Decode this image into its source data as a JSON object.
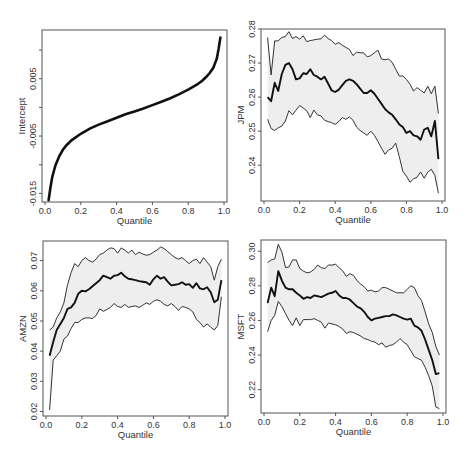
{
  "figure": {
    "layout": "2x2 grid of quantile regression coefficient plots",
    "colors": {
      "band": "#eeeeee",
      "estimate": "#111111",
      "bound": "#333333",
      "frame": "#555555"
    }
  },
  "chart_data": [
    {
      "id": "intercept",
      "type": "line",
      "title": "",
      "xlabel": "Quantile",
      "ylabel": "Intercept",
      "xlim": [
        0.0,
        1.0
      ],
      "ylim": [
        -0.0165,
        0.0135
      ],
      "xticks": [
        0.0,
        0.2,
        0.4,
        0.6,
        0.8,
        1.0
      ],
      "xtick_labels": [
        "0.0",
        "0.2",
        "0.4",
        "0.6",
        "0.8",
        "1.0"
      ],
      "yticks": [
        -0.015,
        -0.01,
        -0.005,
        0.0,
        0.005,
        0.01
      ],
      "ytick_labels": [
        "-0.015",
        "",
        "-0.005",
        "",
        "0.005",
        ""
      ],
      "grid": false,
      "has_band": false,
      "x": [
        0.02,
        0.03,
        0.04,
        0.05,
        0.06,
        0.08,
        0.1,
        0.12,
        0.15,
        0.2,
        0.25,
        0.3,
        0.35,
        0.4,
        0.45,
        0.5,
        0.55,
        0.6,
        0.65,
        0.7,
        0.75,
        0.8,
        0.85,
        0.88,
        0.9,
        0.92,
        0.94,
        0.96,
        0.97,
        0.98
      ],
      "estimate": [
        -0.0162,
        -0.014,
        -0.0122,
        -0.011,
        -0.01,
        -0.0085,
        -0.0074,
        -0.0066,
        -0.0057,
        -0.0046,
        -0.0037,
        -0.003,
        -0.0024,
        -0.0018,
        -0.0012,
        -0.0007,
        -0.0002,
        0.0004,
        0.001,
        0.0016,
        0.0023,
        0.0031,
        0.004,
        0.0047,
        0.0053,
        0.006,
        0.0069,
        0.0085,
        0.0102,
        0.0122
      ]
    },
    {
      "id": "jpm",
      "type": "line",
      "title": "",
      "xlabel": "Quantile",
      "ylabel": "JPM",
      "xlim": [
        0.0,
        1.0
      ],
      "ylim": [
        0.2295,
        0.28
      ],
      "xticks": [
        0.0,
        0.2,
        0.4,
        0.6,
        0.8,
        1.0
      ],
      "xtick_labels": [
        "0.0",
        "0.2",
        "0.4",
        "0.6",
        "0.8",
        "1.0"
      ],
      "yticks": [
        0.24,
        0.25,
        0.26,
        0.27,
        0.28
      ],
      "ytick_labels": [
        "0.24",
        "0.25",
        "0.26",
        "0.27",
        "0.28"
      ],
      "grid": false,
      "has_band": true,
      "x": [
        0.02,
        0.04,
        0.06,
        0.08,
        0.1,
        0.12,
        0.14,
        0.16,
        0.18,
        0.2,
        0.22,
        0.24,
        0.26,
        0.28,
        0.3,
        0.32,
        0.34,
        0.36,
        0.38,
        0.4,
        0.42,
        0.44,
        0.46,
        0.48,
        0.5,
        0.52,
        0.54,
        0.56,
        0.58,
        0.6,
        0.62,
        0.64,
        0.66,
        0.68,
        0.7,
        0.72,
        0.74,
        0.76,
        0.78,
        0.8,
        0.82,
        0.84,
        0.86,
        0.88,
        0.9,
        0.92,
        0.94,
        0.96,
        0.98
      ],
      "upper": [
        0.2775,
        0.2665,
        0.2765,
        0.2765,
        0.2775,
        0.2778,
        0.2792,
        0.2772,
        0.2778,
        0.277,
        0.278,
        0.2763,
        0.2766,
        0.2768,
        0.277,
        0.2771,
        0.2782,
        0.2772,
        0.2766,
        0.2755,
        0.276,
        0.2752,
        0.2746,
        0.274,
        0.2722,
        0.2732,
        0.273,
        0.273,
        0.2718,
        0.2722,
        0.273,
        0.2738,
        0.2712,
        0.271,
        0.2712,
        0.2702,
        0.2682,
        0.2662,
        0.2662,
        0.2652,
        0.2638,
        0.2618,
        0.2628,
        0.262,
        0.2612,
        0.2632,
        0.261,
        0.2632,
        0.2552
      ],
      "estimate": [
        0.26,
        0.2588,
        0.2642,
        0.2618,
        0.2668,
        0.2695,
        0.27,
        0.2682,
        0.2652,
        0.2655,
        0.267,
        0.2668,
        0.2682,
        0.2665,
        0.266,
        0.2652,
        0.266,
        0.264,
        0.262,
        0.2615,
        0.2622,
        0.2635,
        0.2648,
        0.2652,
        0.2648,
        0.2638,
        0.2625,
        0.2612,
        0.2612,
        0.262,
        0.261,
        0.2595,
        0.258,
        0.2565,
        0.2555,
        0.2548,
        0.2535,
        0.252,
        0.2512,
        0.2495,
        0.25,
        0.2488,
        0.2485,
        0.2475,
        0.2505,
        0.251,
        0.2485,
        0.253,
        0.2418
      ],
      "lower": [
        0.2535,
        0.2508,
        0.2502,
        0.251,
        0.2515,
        0.253,
        0.256,
        0.2548,
        0.2562,
        0.2575,
        0.2568,
        0.256,
        0.254,
        0.2562,
        0.2548,
        0.2545,
        0.2532,
        0.2528,
        0.2525,
        0.252,
        0.2528,
        0.254,
        0.2535,
        0.2542,
        0.2532,
        0.2512,
        0.2502,
        0.2495,
        0.2488,
        0.25,
        0.2488,
        0.247,
        0.245,
        0.2432,
        0.2445,
        0.245,
        0.2465,
        0.2425,
        0.2382,
        0.2368,
        0.235,
        0.236,
        0.2365,
        0.238,
        0.2362,
        0.238,
        0.2388,
        0.237,
        0.2318
      ]
    },
    {
      "id": "amzn",
      "type": "line",
      "title": "",
      "xlabel": "Quantile",
      "ylabel": "AMZN",
      "xlim": [
        0.0,
        1.0
      ],
      "ylim": [
        0.0185,
        0.0765
      ],
      "xticks": [
        0.0,
        0.2,
        0.4,
        0.6,
        0.8,
        1.0
      ],
      "xtick_labels": [
        "0.0",
        "0.2",
        "0.4",
        "0.6",
        "0.8",
        "1.0"
      ],
      "yticks": [
        0.02,
        0.03,
        0.04,
        0.05,
        0.06,
        0.07
      ],
      "ytick_labels": [
        "0.02",
        "0.03",
        "0.04",
        "0.05",
        "0.06",
        "0.07"
      ],
      "grid": false,
      "has_band": true,
      "x": [
        0.02,
        0.04,
        0.06,
        0.08,
        0.1,
        0.12,
        0.14,
        0.16,
        0.18,
        0.2,
        0.22,
        0.24,
        0.26,
        0.28,
        0.3,
        0.32,
        0.34,
        0.36,
        0.38,
        0.4,
        0.42,
        0.44,
        0.46,
        0.48,
        0.5,
        0.52,
        0.54,
        0.56,
        0.58,
        0.6,
        0.62,
        0.64,
        0.66,
        0.68,
        0.7,
        0.72,
        0.74,
        0.76,
        0.78,
        0.8,
        0.82,
        0.84,
        0.86,
        0.88,
        0.9,
        0.92,
        0.94,
        0.96,
        0.98
      ],
      "upper": [
        0.047,
        0.048,
        0.051,
        0.053,
        0.056,
        0.062,
        0.066,
        0.069,
        0.068,
        0.07,
        0.071,
        0.07,
        0.0695,
        0.0705,
        0.072,
        0.0725,
        0.0735,
        0.0742,
        0.074,
        0.0725,
        0.0742,
        0.0735,
        0.0725,
        0.0735,
        0.072,
        0.0728,
        0.0722,
        0.0718,
        0.072,
        0.0728,
        0.0735,
        0.0745,
        0.074,
        0.073,
        0.072,
        0.071,
        0.0705,
        0.071,
        0.07,
        0.069,
        0.07,
        0.0705,
        0.069,
        0.071,
        0.0695,
        0.068,
        0.0635,
        0.068,
        0.0705
      ],
      "estimate": [
        0.0385,
        0.043,
        0.047,
        0.049,
        0.051,
        0.054,
        0.0545,
        0.056,
        0.059,
        0.06,
        0.0598,
        0.0605,
        0.0615,
        0.0625,
        0.0635,
        0.065,
        0.0645,
        0.064,
        0.065,
        0.0652,
        0.066,
        0.0648,
        0.064,
        0.0638,
        0.0635,
        0.0632,
        0.063,
        0.0628,
        0.062,
        0.0638,
        0.065,
        0.064,
        0.0645,
        0.063,
        0.0618,
        0.062,
        0.0622,
        0.0628,
        0.062,
        0.0622,
        0.061,
        0.0625,
        0.0608,
        0.0605,
        0.0612,
        0.0595,
        0.0562,
        0.057,
        0.0635
      ],
      "lower": [
        0.0205,
        0.037,
        0.0385,
        0.04,
        0.044,
        0.045,
        0.0475,
        0.0495,
        0.0495,
        0.0505,
        0.051,
        0.051,
        0.0508,
        0.0518,
        0.054,
        0.0532,
        0.0538,
        0.0545,
        0.0558,
        0.0548,
        0.0545,
        0.0555,
        0.0545,
        0.0548,
        0.055,
        0.0545,
        0.0552,
        0.056,
        0.0555,
        0.0565,
        0.057,
        0.0565,
        0.0555,
        0.055,
        0.0558,
        0.0548,
        0.0535,
        0.0548,
        0.0545,
        0.054,
        0.053,
        0.0505,
        0.0495,
        0.048,
        0.049,
        0.048,
        0.047,
        0.0485,
        0.058
      ]
    },
    {
      "id": "msft",
      "type": "line",
      "title": "",
      "xlabel": "Quantile",
      "ylabel": "MSFT",
      "xlim": [
        0.0,
        1.0
      ],
      "ylim": [
        0.2065,
        0.3065
      ],
      "xticks": [
        0.0,
        0.2,
        0.4,
        0.6,
        0.8,
        1.0
      ],
      "xtick_labels": [
        "0.0",
        "0.2",
        "0.4",
        "0.6",
        "0.8",
        "1.0"
      ],
      "yticks": [
        0.22,
        0.24,
        0.26,
        0.28,
        0.3
      ],
      "ytick_labels": [
        "0.22",
        "0.24",
        "0.26",
        "0.28",
        "0.30"
      ],
      "grid": false,
      "has_band": true,
      "x": [
        0.02,
        0.04,
        0.06,
        0.08,
        0.1,
        0.12,
        0.14,
        0.16,
        0.18,
        0.2,
        0.22,
        0.24,
        0.26,
        0.28,
        0.3,
        0.32,
        0.34,
        0.36,
        0.38,
        0.4,
        0.42,
        0.44,
        0.46,
        0.48,
        0.5,
        0.52,
        0.54,
        0.56,
        0.58,
        0.6,
        0.62,
        0.64,
        0.66,
        0.68,
        0.7,
        0.72,
        0.74,
        0.76,
        0.78,
        0.8,
        0.82,
        0.84,
        0.86,
        0.88,
        0.9,
        0.92,
        0.94,
        0.96,
        0.98
      ],
      "upper": [
        0.2935,
        0.295,
        0.2955,
        0.304,
        0.2995,
        0.2905,
        0.291,
        0.295,
        0.295,
        0.29,
        0.2885,
        0.2875,
        0.288,
        0.2895,
        0.292,
        0.2905,
        0.29,
        0.292,
        0.292,
        0.2925,
        0.2905,
        0.2885,
        0.2855,
        0.287,
        0.286,
        0.283,
        0.281,
        0.2795,
        0.277,
        0.2775,
        0.2765,
        0.277,
        0.279,
        0.279,
        0.278,
        0.277,
        0.276,
        0.276,
        0.276,
        0.278,
        0.28,
        0.279,
        0.2745,
        0.2715,
        0.265,
        0.258,
        0.253,
        0.245,
        0.24
      ],
      "estimate": [
        0.27,
        0.279,
        0.274,
        0.2885,
        0.283,
        0.279,
        0.278,
        0.278,
        0.276,
        0.2745,
        0.2725,
        0.2735,
        0.273,
        0.2745,
        0.274,
        0.2735,
        0.2745,
        0.2755,
        0.276,
        0.277,
        0.2745,
        0.273,
        0.273,
        0.272,
        0.27,
        0.268,
        0.267,
        0.265,
        0.262,
        0.26,
        0.261,
        0.2615,
        0.262,
        0.2625,
        0.2625,
        0.2635,
        0.263,
        0.262,
        0.261,
        0.2605,
        0.261,
        0.257,
        0.256,
        0.254,
        0.249,
        0.243,
        0.237,
        0.229,
        0.2295
      ],
      "lower": [
        0.2535,
        0.26,
        0.263,
        0.271,
        0.268,
        0.264,
        0.26,
        0.257,
        0.2615,
        0.257,
        0.2605,
        0.2605,
        0.2605,
        0.261,
        0.26,
        0.259,
        0.2555,
        0.2585,
        0.258,
        0.2575,
        0.2565,
        0.255,
        0.2525,
        0.2535,
        0.253,
        0.252,
        0.251,
        0.2495,
        0.249,
        0.248,
        0.2475,
        0.246,
        0.247,
        0.2445,
        0.2455,
        0.246,
        0.2475,
        0.2495,
        0.2475,
        0.246,
        0.2425,
        0.239,
        0.238,
        0.237,
        0.233,
        0.228,
        0.222,
        0.21,
        0.209
      ]
    }
  ]
}
